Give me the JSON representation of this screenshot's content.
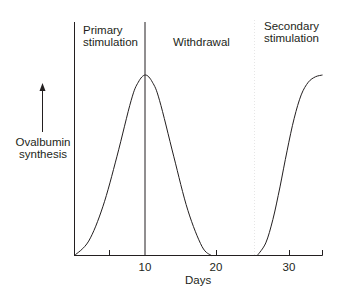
{
  "chart_data": {
    "type": "line",
    "title": "",
    "xlabel": "Days",
    "ylabel": "Ovalbumin synthesis",
    "xlim": [
      0,
      35
    ],
    "ylim": [
      0,
      1
    ],
    "x_ticks": [
      5,
      10,
      20,
      30,
      35
    ],
    "x_tick_labels": [
      "10",
      "20",
      "30"
    ],
    "x_tick_label_positions": [
      10,
      20,
      30
    ],
    "y_ticks": [],
    "grid": false,
    "legend": null,
    "phases": [
      {
        "name": "Primary stimulation",
        "start": 0,
        "end": 10
      },
      {
        "name": "Withdrawal",
        "start": 10,
        "end": 25.5
      },
      {
        "name": "Secondary stimulation",
        "start": 25.5,
        "end": 35
      }
    ],
    "phase_dividers": [
      {
        "x": 0,
        "style": "solid"
      },
      {
        "x": 10,
        "style": "solid"
      },
      {
        "x": 25.5,
        "style": "dotted-faint"
      }
    ],
    "series": [
      {
        "name": "Primary response",
        "x": [
          0,
          2,
          4,
          6,
          8,
          9,
          10,
          11,
          12,
          14,
          16,
          18,
          19.3
        ],
        "y": [
          0,
          0.08,
          0.27,
          0.55,
          0.86,
          0.96,
          1.0,
          0.96,
          0.86,
          0.55,
          0.25,
          0.05,
          0
        ]
      },
      {
        "name": "Secondary response",
        "x": [
          25.8,
          27,
          28,
          29,
          30,
          31,
          32,
          33,
          34,
          35
        ],
        "y": [
          0,
          0.07,
          0.2,
          0.38,
          0.58,
          0.76,
          0.89,
          0.96,
          0.99,
          1.0
        ]
      }
    ],
    "annotations": [
      {
        "text": "Primary stimulation",
        "position": "top-left phase"
      },
      {
        "text": "Withdrawal",
        "position": "top-middle phase"
      },
      {
        "text": "Secondary stimulation",
        "position": "top-right phase"
      },
      {
        "text": "↑ Ovalbumin synthesis",
        "position": "left of y-axis with upward arrow"
      }
    ]
  },
  "labels": {
    "phase_primary_line1": "Primary",
    "phase_primary_line2": "stimulation",
    "phase_withdrawal": "Withdrawal",
    "phase_secondary_line1": "Secondary",
    "phase_secondary_line2": "stimulation",
    "ylabel_line1": "Ovalbumin",
    "ylabel_line2": "synthesis",
    "xlabel": "Days",
    "tick_10": "10",
    "tick_20": "20",
    "tick_30": "30"
  },
  "colors": {
    "ink": "#231f20",
    "faint_divider": "#e6e6e6"
  }
}
